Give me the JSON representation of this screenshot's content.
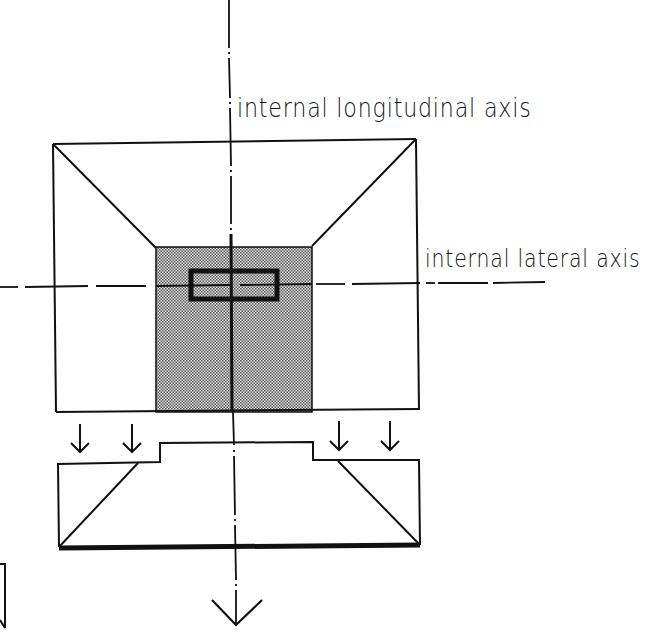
{
  "diagram": {
    "labels": {
      "longitudinal_axis": "internal longitudinal axis",
      "lateral_axis": "internal lateral axis"
    },
    "colors": {
      "ink": "#111111",
      "shaded_fill": "#b8b8b8",
      "background": "#ffffff"
    },
    "elements": {
      "plan_view": "outer square plan with shaded central core and small rectangle at axis intersection",
      "section_view": "stepped section below plan with sloped sides and thick base line",
      "load_arrows": 4,
      "direction_arrow": "large downward arrow on longitudinal axis"
    }
  }
}
